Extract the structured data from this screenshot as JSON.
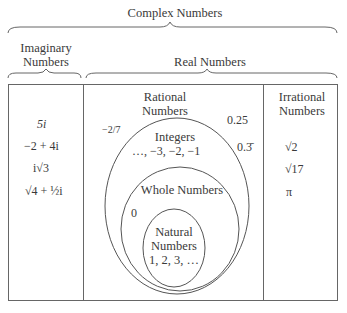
{
  "labels": {
    "complex": "Complex Numbers",
    "imaginary_line1": "Imaginary",
    "imaginary_line2": "Numbers",
    "real": "Real Numbers",
    "rational_line1": "Rational",
    "rational_line2": "Numbers",
    "irrational_line1": "Irrational",
    "irrational_line2": "Numbers",
    "integers": "Integers",
    "whole": "Whole Numbers",
    "natural_line1": "Natural",
    "natural_line2": "Numbers"
  },
  "imaginary_examples": [
    "5i",
    "−2 + 4i",
    "i√3",
    "√4 + ½i"
  ],
  "rational_examples": {
    "neg_two_sevenths": "−2/7",
    "quarter": "0.25",
    "repeating_third": "0.3̄"
  },
  "integers_examples": "…, −3, −2, −1",
  "whole_examples": "0",
  "natural_examples": "1, 2, 3, …",
  "irrational_examples": [
    "√2",
    "√17",
    "π"
  ],
  "colors": {
    "line": "#555555",
    "text": "#3a3a3a",
    "background": "#ffffff"
  }
}
